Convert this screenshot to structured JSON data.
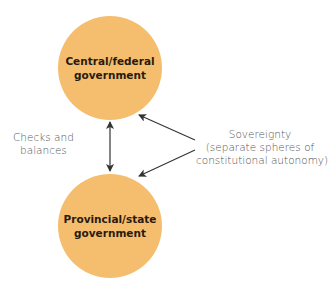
{
  "colors": {
    "circle_fill": "#F5BE6E",
    "circle_text": "#2A1A0E",
    "label_text": "#555555",
    "arrow": "#333333",
    "background": "#FFFFFF"
  },
  "nodes": {
    "central": {
      "line1": "Central/federal",
      "line2": "government"
    },
    "provincial": {
      "line1": "Provincial/state",
      "line2": "government"
    }
  },
  "labels": {
    "checks": {
      "line1": "Checks and",
      "line2": "balances"
    },
    "sovereignty": {
      "line1": "Sovereignty",
      "line2": "(separate spheres of",
      "line3": "constitutional autonomy)"
    }
  },
  "edges": [
    {
      "from": "central",
      "to": "provincial",
      "type": "bidirectional",
      "label": "Checks and balances"
    },
    {
      "from": "sovereignty-label",
      "to": "central",
      "type": "directed"
    },
    {
      "from": "sovereignty-label",
      "to": "provincial",
      "type": "directed"
    }
  ]
}
